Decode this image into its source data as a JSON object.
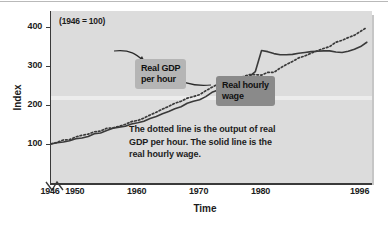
{
  "chart_data": {
    "type": "line",
    "title": "",
    "subtitle": "",
    "base_note": "(1946 = 100)",
    "xlabel": "Time",
    "ylabel": "Index",
    "xlim": [
      1946,
      1998
    ],
    "ylim": [
      0,
      440
    ],
    "grid": false,
    "legend_position": "annotation-callouts",
    "x_ticks": [
      1946,
      1950,
      1960,
      1970,
      1980,
      1996
    ],
    "x_tick_labels": [
      "1946",
      "1950",
      "1960",
      "1970",
      "1980",
      "1996"
    ],
    "y_ticks": [
      100,
      200,
      300,
      400
    ],
    "y_tick_labels": [
      "100",
      "200",
      "300",
      "400"
    ],
    "axis_break": true,
    "x": [
      1946,
      1947,
      1948,
      1949,
      1950,
      1951,
      1952,
      1953,
      1954,
      1955,
      1956,
      1957,
      1958,
      1959,
      1960,
      1961,
      1962,
      1963,
      1964,
      1965,
      1966,
      1967,
      1968,
      1969,
      1970,
      1971,
      1972,
      1973,
      1974,
      1975,
      1976,
      1977,
      1978,
      1979,
      1980,
      1981,
      1982,
      1983,
      1984,
      1985,
      1986,
      1987,
      1988,
      1989,
      1990,
      1991,
      1992,
      1993,
      1994,
      1995,
      1996,
      1997
    ],
    "series": [
      {
        "name": "Real GDP per hour",
        "style": "dotted",
        "color": "#3a3a3a",
        "values": [
          100,
          104,
          110,
          111,
          118,
          122,
          125,
          131,
          133,
          140,
          141,
          145,
          150,
          157,
          160,
          166,
          174,
          181,
          189,
          196,
          204,
          209,
          217,
          221,
          226,
          236,
          245,
          253,
          249,
          255,
          265,
          272,
          277,
          277,
          276,
          283,
          283,
          294,
          303,
          311,
          320,
          325,
          332,
          338,
          344,
          349,
          360,
          365,
          372,
          378,
          388,
          398
        ]
      },
      {
        "name": "Real hourly wage",
        "style": "solid",
        "color": "#3a3a3a",
        "values": [
          100,
          103,
          105,
          108,
          113,
          115,
          119,
          126,
          128,
          134,
          140,
          143,
          145,
          151,
          154,
          158,
          165,
          170,
          177,
          183,
          190,
          195,
          204,
          209,
          213,
          221,
          232,
          238,
          236,
          242,
          252,
          261,
          272,
          285,
          339,
          336,
          331,
          328,
          328,
          329,
          332,
          334,
          336,
          337,
          338,
          338,
          335,
          334,
          337,
          342,
          349,
          360
        ]
      }
    ],
    "annotations": [
      {
        "name": "callout-gdp",
        "lines": [
          "Real GDP",
          "per hour"
        ],
        "target": "dotted-line",
        "background": "#b5b5b5"
      },
      {
        "name": "callout-wage",
        "lines": [
          "Real hourly",
          "wage"
        ],
        "target": "solid-line",
        "background": "#8a8a8a"
      }
    ],
    "caption_lines": [
      "The dotted line is the output of real",
      "GDP per hour. The solid line is the",
      "real hourly wage."
    ],
    "colors": {
      "plot_background": "#dcdcdc",
      "page_background": "#ffffff",
      "axis": "#3a3a3a",
      "text": "#1c1c1c",
      "shadow": "#c6c6c6"
    }
  }
}
